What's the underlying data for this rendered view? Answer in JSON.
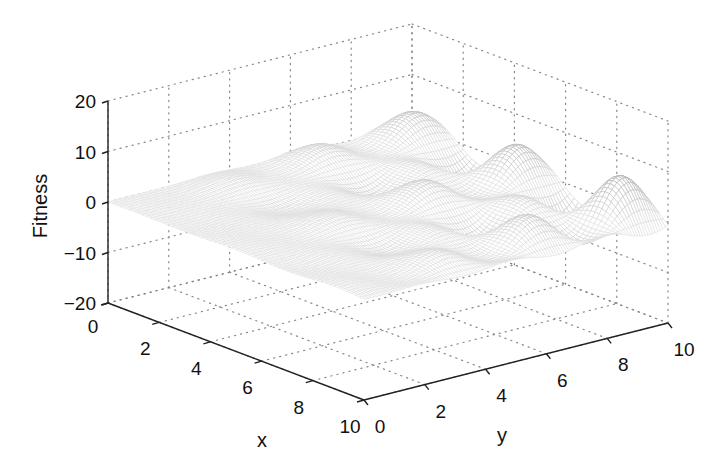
{
  "chart_data": {
    "type": "surface",
    "title": "",
    "xlabel": "x",
    "ylabel": "y",
    "zlabel": "Fitness",
    "xlim": [
      0,
      10
    ],
    "ylim": [
      0,
      10
    ],
    "zlim": [
      -20,
      20
    ],
    "xticks": [
      "0",
      "2",
      "4",
      "6",
      "8",
      "10"
    ],
    "yticks": [
      "0",
      "2",
      "4",
      "6",
      "8",
      "10"
    ],
    "zticks": [
      "−20",
      "−10",
      "0",
      "10",
      "20"
    ],
    "zticks_values": [
      -20,
      -10,
      0,
      10,
      20
    ],
    "grid": true,
    "grid_style": "dotted",
    "colormap": "grayscale",
    "mesh": {
      "x_samples": 60,
      "y_samples": 120,
      "function_description": "oscillating fitness landscape; amplitude grows with x and y, ~4 ridges along x and ~6 along y",
      "z_range_observed": [
        -20,
        18
      ]
    }
  },
  "labels": {
    "x": "x",
    "y": "y",
    "z": "Fitness"
  }
}
